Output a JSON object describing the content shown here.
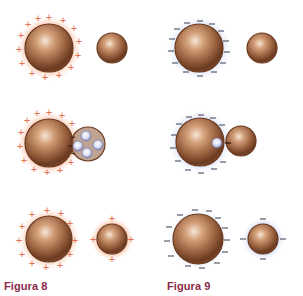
{
  "figures": [
    {
      "label": "Figura 8",
      "charge_sign": "+",
      "description": "Positively charged sphere touches a neutral sphere; electrons move to the charged sphere; both end up positively charged",
      "glow_color": "#f4a27a",
      "charge_color": "#e0603a",
      "rows": [
        {
          "stage": "before",
          "large_charged": true,
          "small_charged": false
        },
        {
          "stage": "contact",
          "transfer": "electrons from small to large",
          "electron_count": 4
        },
        {
          "stage": "after",
          "large_charged": true,
          "small_charged": true
        }
      ]
    },
    {
      "label": "Figura 9",
      "charge_sign": "−",
      "description": "Negatively charged sphere touches a neutral sphere; electrons move to the neutral sphere; both end up negatively charged",
      "glow_color": "#bcc8ee",
      "charge_color": "#4a4f62",
      "rows": [
        {
          "stage": "before",
          "large_charged": true,
          "small_charged": false
        },
        {
          "stage": "contact",
          "transfer": "electron from large to small",
          "electron_count": 1
        },
        {
          "stage": "after",
          "large_charged": true,
          "small_charged": true
        }
      ]
    }
  ],
  "colors": {
    "sphere_light": "#f3dcc8",
    "sphere_mid": "#b57b52",
    "sphere_dark": "#5b2f18",
    "caption": "#8a2a4a"
  }
}
